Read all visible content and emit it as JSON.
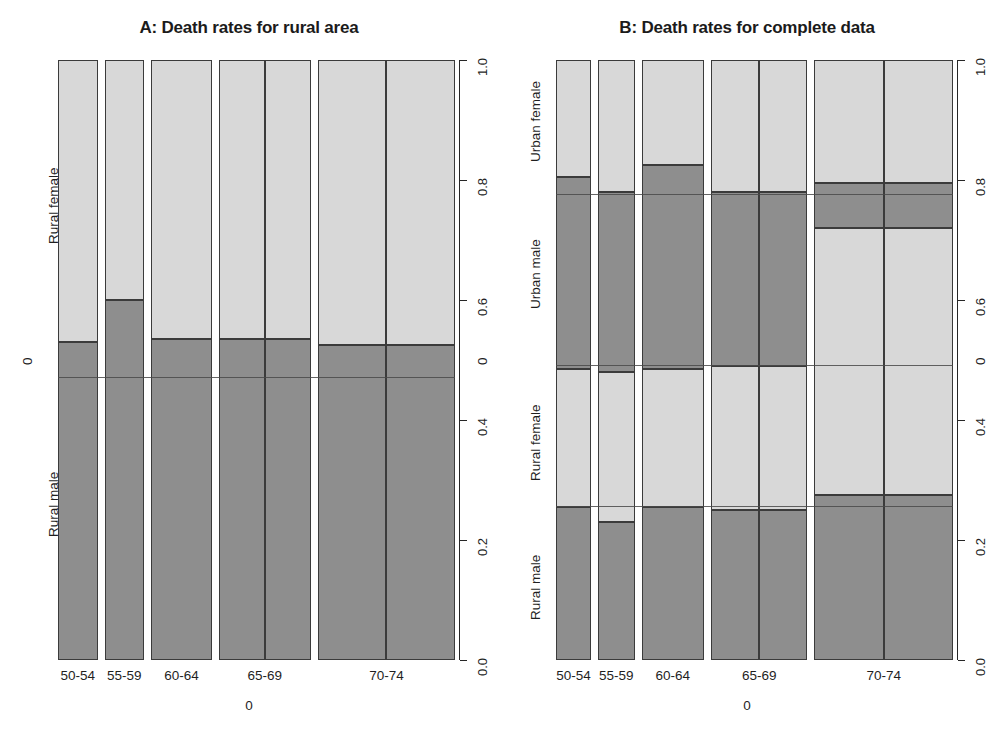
{
  "figure": {
    "background": "#ffffff",
    "colors": {
      "dark_grey": "#8e8e8e",
      "light_grey": "#d8d8d8",
      "border": "#3b3b3b",
      "axis": "#262626"
    }
  },
  "panelA": {
    "title": "A: Death rates for rural area",
    "x_axis_title": "0",
    "y_axis_title": "0",
    "x_categories": [
      "50-54",
      "55-59",
      "60-64",
      "65-69",
      "70-74"
    ],
    "y_ticks": [
      "0.0",
      "0.2",
      "0.4",
      "0.6",
      "0.8",
      "1.0"
    ],
    "row_labels": [
      "Rural female",
      "Rural male"
    ]
  },
  "panelB": {
    "title": "B: Death rates for complete data",
    "x_axis_title": "0",
    "y_axis_title": "0",
    "x_categories": [
      "50-54",
      "55-59",
      "60-64",
      "65-69",
      "70-74"
    ],
    "y_ticks": [
      "0.0",
      "0.2",
      "0.4",
      "0.6",
      "0.8",
      "1.0"
    ],
    "row_labels": [
      "Urban female",
      "Urban male",
      "Rural female",
      "Rural male"
    ]
  },
  "chart_data": [
    {
      "type": "bar",
      "id": "panel-A",
      "title": "A: Death rates for rural area",
      "subtitle": "",
      "xlabel": "0",
      "ylabel": "0",
      "ylim": [
        0.0,
        1.0
      ],
      "grid": false,
      "legend": "none",
      "note": "Mosaic / spine plot. Column widths proportional to age-group marginal counts; within each column the vertical split gives conditional proportions of Rural male (dark, bottom) and Rural female (light, top).",
      "categories": [
        "50-54",
        "55-59",
        "60-64",
        "65-69",
        "70-74"
      ],
      "column_widths": [
        0.088,
        0.088,
        0.135,
        0.205,
        0.305
      ],
      "column_subsplits": [
        1,
        1,
        1,
        2,
        2
      ],
      "series": [
        {
          "name": "Rural male",
          "color": "#8e8e8e",
          "values": [
            0.53,
            0.6,
            0.535,
            0.535,
            0.525
          ]
        },
        {
          "name": "Rural female",
          "color": "#d8d8d8",
          "values": [
            0.47,
            0.4,
            0.465,
            0.465,
            0.475
          ]
        }
      ],
      "reference_lines": [
        0.47
      ]
    },
    {
      "type": "bar",
      "id": "panel-B",
      "title": "B: Death rates for complete data",
      "subtitle": "",
      "xlabel": "0",
      "ylabel": "0",
      "ylim": [
        0.0,
        1.0
      ],
      "grid": false,
      "legend": "none",
      "note": "Mosaic / spine plot with four stacked groups (bottom to top): Rural male, Rural female, Urban male, Urban female.",
      "categories": [
        "50-54",
        "55-59",
        "60-64",
        "65-69",
        "70-74"
      ],
      "column_widths": [
        0.078,
        0.082,
        0.14,
        0.215,
        0.31
      ],
      "column_subsplits": [
        1,
        1,
        1,
        2,
        2
      ],
      "series": [
        {
          "name": "Rural male",
          "color": "#8e8e8e",
          "values": [
            0.255,
            0.23,
            0.255,
            0.25,
            0.275
          ]
        },
        {
          "name": "Rural female",
          "color": "#d8d8d8",
          "values": [
            0.23,
            0.25,
            0.23,
            0.24,
            0.445
          ]
        },
        {
          "name": "Urban male",
          "color": "#8e8e8e",
          "values": [
            0.32,
            0.3,
            0.34,
            0.29,
            0.075
          ]
        },
        {
          "name": "Urban female",
          "color": "#d8d8d8",
          "values": [
            0.195,
            0.22,
            0.175,
            0.22,
            0.205
          ]
        }
      ],
      "reference_lines": [
        0.255,
        0.49,
        0.775
      ]
    }
  ]
}
